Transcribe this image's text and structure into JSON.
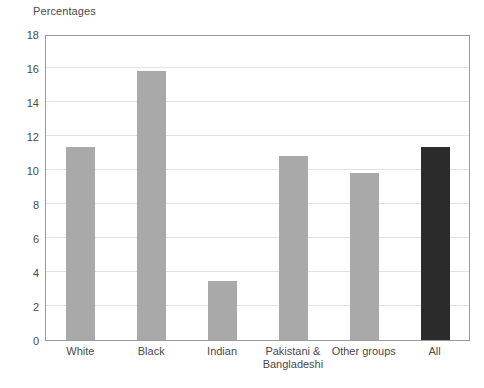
{
  "chart_data": {
    "type": "bar",
    "title": "Percentages",
    "xlabel": "",
    "ylabel": "",
    "ylim": [
      0,
      18
    ],
    "ytick_step": 2,
    "yticks": [
      18,
      16,
      14,
      12,
      10,
      8,
      6,
      4,
      2,
      0
    ],
    "grid": true,
    "legend": "none",
    "categories": [
      "White",
      "Pakistani & Bangladeshi",
      "Black",
      "Indian",
      "Other groups",
      "All"
    ],
    "category_labels": [
      {
        "line1": "White",
        "line2": ""
      },
      {
        "line1": "Black",
        "line2": ""
      },
      {
        "line1": "Indian",
        "line2": ""
      },
      {
        "line1": "Pakistani &",
        "line2": "Bangladeshi"
      },
      {
        "line1": "Other groups",
        "line2": ""
      },
      {
        "line1": "All",
        "line2": ""
      }
    ],
    "values": [
      11.35,
      15.8,
      3.5,
      10.8,
      9.8,
      11.35
    ],
    "bar_colors": [
      "#a9a9a9",
      "#a9a9a9",
      "#a9a9a9",
      "#a9a9a9",
      "#a9a9a9",
      "#2b2b2b"
    ],
    "series": [
      {
        "name": "Percentages",
        "values": [
          11.35,
          15.8,
          3.5,
          10.8,
          9.8,
          11.35
        ]
      }
    ]
  },
  "colors": {
    "bar_gray": "#a9a9a9",
    "bar_dark": "#2b2b2b",
    "gridline": "#e2e2e2",
    "axis": "#9a9a9a",
    "text": "#4a4a4a",
    "background": "#ffffff"
  }
}
